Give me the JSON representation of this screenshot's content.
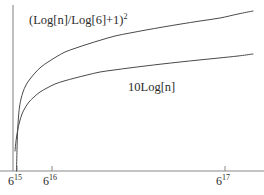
{
  "chart_data": {
    "type": "line",
    "title": "",
    "xlabel": "",
    "ylabel": "",
    "grid": false,
    "legend": "inline-annotations",
    "axes": {
      "x_axis_line_y": 171,
      "y_axis_line_x": 13,
      "x_scale": "logarithmic",
      "xlim_labels": [
        "6^15",
        "6^17.35"
      ],
      "ylim": [
        0,
        100
      ]
    },
    "xticks": [
      {
        "base": "6",
        "exponent": "15",
        "pixel_x": 17
      },
      {
        "base": "6",
        "exponent": "16",
        "pixel_x": 52
      },
      {
        "base": "6",
        "exponent": "17",
        "pixel_x": 225
      }
    ],
    "yticks": [],
    "series": [
      {
        "name": "(Log[n]/Log[6]+1)",
        "name_exponent": "2",
        "label_prefix": "(Log[n]/Log[6]+1)",
        "label_sup": "2",
        "color": "#4a4a4a",
        "linewidth": 1,
        "annotation_x": 29,
        "annotation_y": 14,
        "points": [
          [
            16.5,
            171
          ],
          [
            17.0,
            150
          ],
          [
            17.6,
            132
          ],
          [
            18.4,
            118
          ],
          [
            19.5,
            107
          ],
          [
            21.0,
            99
          ],
          [
            23.0,
            92
          ],
          [
            26.0,
            85
          ],
          [
            30.0,
            79
          ],
          [
            35.0,
            73
          ],
          [
            41.0,
            67
          ],
          [
            48.0,
            62
          ],
          [
            56.0,
            57
          ],
          [
            65.0,
            52
          ],
          [
            76.0,
            48
          ],
          [
            88.0,
            44
          ],
          [
            101.0,
            40
          ],
          [
            115.0,
            36
          ],
          [
            130.0,
            33
          ],
          [
            146.0,
            30
          ],
          [
            163.0,
            27
          ],
          [
            181.0,
            24
          ],
          [
            200.0,
            21
          ],
          [
            220.0,
            18
          ],
          [
            238.0,
            14
          ],
          [
            253.0,
            11
          ]
        ]
      },
      {
        "name": "10Log[n]",
        "label_prefix": "10Log[n]",
        "label_sup": "",
        "color": "#4a4a4a",
        "linewidth": 1,
        "annotation_x": 128,
        "annotation_y": 81,
        "points": [
          [
            15.0,
            151
          ],
          [
            16.0,
            141
          ],
          [
            17.5,
            131
          ],
          [
            19.5,
            122
          ],
          [
            22.0,
            114
          ],
          [
            25.0,
            108
          ],
          [
            29.0,
            102
          ],
          [
            34.0,
            97
          ],
          [
            40.0,
            92
          ],
          [
            47.0,
            88
          ],
          [
            55.0,
            84
          ],
          [
            64.0,
            81
          ],
          [
            75.0,
            78
          ],
          [
            87.0,
            75
          ],
          [
            100.0,
            72
          ],
          [
            114.0,
            70
          ],
          [
            129.0,
            68
          ],
          [
            145.0,
            66
          ],
          [
            162.0,
            64
          ],
          [
            180.0,
            62
          ],
          [
            199.0,
            60
          ],
          [
            219.0,
            58
          ],
          [
            238.0,
            56
          ],
          [
            253.0,
            54
          ]
        ]
      }
    ],
    "crossing_point": {
      "pixel_x": 38,
      "pixel_y": 93
    },
    "colors": {
      "background": "#ffffff",
      "axis": "#8a8a8a",
      "curve": "#4a4a4a",
      "text": "#2b2b2b"
    }
  },
  "labels": {
    "upper_curve": {
      "text": "(Log[n]/Log[6]+1)",
      "sup": "2"
    },
    "lower_curve": {
      "text": "10Log[n]",
      "sup": ""
    }
  },
  "xticks": [
    {
      "base": "6",
      "exponent": "15"
    },
    {
      "base": "6",
      "exponent": "16"
    },
    {
      "base": "6",
      "exponent": "17"
    }
  ]
}
